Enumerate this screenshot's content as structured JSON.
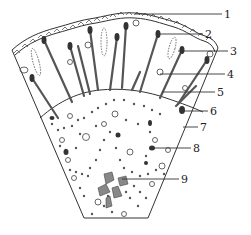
{
  "diagram": {
    "type": "anatomical-cross-section-wedge",
    "colors": {
      "ink": "#333333",
      "background": "#ffffff",
      "cell_fill": "#777777"
    },
    "callouts": [
      {
        "id": 1,
        "label": "1",
        "x": 227,
        "y": 15
      },
      {
        "id": 2,
        "label": "2",
        "x": 208,
        "y": 34
      },
      {
        "id": 3,
        "label": "3",
        "x": 233,
        "y": 52
      },
      {
        "id": 4,
        "label": "4",
        "x": 230,
        "y": 75
      },
      {
        "id": 5,
        "label": "5",
        "x": 220,
        "y": 93
      },
      {
        "id": 6,
        "label": "6",
        "x": 213,
        "y": 112
      },
      {
        "id": 7,
        "label": "7",
        "x": 203,
        "y": 128
      },
      {
        "id": 8,
        "label": "8",
        "x": 196,
        "y": 149
      },
      {
        "id": 9,
        "label": "9",
        "x": 184,
        "y": 180
      }
    ]
  }
}
